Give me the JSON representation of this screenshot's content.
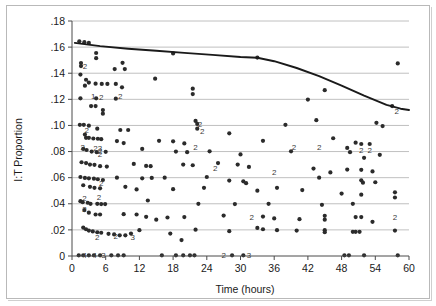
{
  "chart_data": {
    "type": "scatter",
    "title": "",
    "xlabel": "Time (hours)",
    "ylabel": "I:T Proportion",
    "xlim": [
      0,
      60
    ],
    "ylim": [
      0,
      0.18
    ],
    "grid": true,
    "legend": "none",
    "x_ticks": [
      "0",
      "6",
      "12",
      "18",
      "24",
      "30",
      "36",
      "42",
      "48",
      "54",
      "60"
    ],
    "x_tick_values": [
      0,
      6,
      12,
      18,
      24,
      30,
      36,
      42,
      48,
      54,
      60
    ],
    "y_ticks": [
      "0",
      ".02",
      ".04",
      ".06",
      ".08",
      ".10",
      ".12",
      ".14",
      ".16",
      ".18"
    ],
    "y_tick_values": [
      0,
      0.02,
      0.04,
      0.06,
      0.08,
      0.1,
      0.12,
      0.14,
      0.16,
      0.18
    ],
    "series": [
      {
        "name": "I:T Proportion observations",
        "marker": "filled-circle",
        "color": "#2b2b2b",
        "points": [
          [
            1.3,
            0.1645
          ],
          [
            2.2,
            0.1638
          ],
          [
            3.0,
            0.1632
          ],
          [
            4.3,
            0.1555
          ],
          [
            4.3,
            0.1515
          ],
          [
            9.0,
            0.148
          ],
          [
            1.6,
            0.1478
          ],
          [
            1.6,
            0.1455
          ],
          [
            18.0,
            0.1552
          ],
          [
            58.0,
            0.1475
          ],
          [
            7.6,
            0.1432
          ],
          [
            9.4,
            0.1432
          ],
          [
            1.5,
            0.139
          ],
          [
            2.5,
            0.135
          ],
          [
            3.0,
            0.1328
          ],
          [
            2.3,
            0.1305
          ],
          [
            4.2,
            0.132
          ],
          [
            5.3,
            0.1318
          ],
          [
            6.3,
            0.1318
          ],
          [
            7.8,
            0.1318
          ],
          [
            8.9,
            0.1292
          ],
          [
            14.8,
            0.1358
          ],
          [
            21.5,
            0.1282
          ],
          [
            21.5,
            0.124
          ],
          [
            33.0,
            0.152
          ],
          [
            45.0,
            0.127
          ],
          [
            1.5,
            0.1208
          ],
          [
            4.3,
            0.1208
          ],
          [
            7.8,
            0.1205
          ],
          [
            42.0,
            0.1198
          ],
          [
            3.4,
            0.1148
          ],
          [
            4.2,
            0.1148
          ],
          [
            5.5,
            0.1118
          ],
          [
            5.5,
            0.109
          ],
          [
            22.0,
            0.1035
          ],
          [
            22.3,
            0.1012
          ],
          [
            22.3,
            0.0975
          ],
          [
            28.0,
            0.094
          ],
          [
            38.0,
            0.1005
          ],
          [
            43.5,
            0.104
          ],
          [
            54.2,
            0.102
          ],
          [
            55.3,
            0.0995
          ],
          [
            57.0,
            0.1148
          ],
          [
            1.4,
            0.1005
          ],
          [
            2.1,
            0.1005
          ],
          [
            3.0,
            0.0998
          ],
          [
            4.5,
            0.0975
          ],
          [
            8.6,
            0.0965
          ],
          [
            10.0,
            0.0965
          ],
          [
            2.3,
            0.093
          ],
          [
            2.5,
            0.0905
          ],
          [
            3.0,
            0.0905
          ],
          [
            3.8,
            0.09
          ],
          [
            4.6,
            0.0898
          ],
          [
            5.2,
            0.0895
          ],
          [
            8.0,
            0.088
          ],
          [
            9.2,
            0.0865
          ],
          [
            15.5,
            0.0882
          ],
          [
            18.0,
            0.0878
          ],
          [
            20.0,
            0.0862
          ],
          [
            34.0,
            0.0882
          ],
          [
            46.5,
            0.0902
          ],
          [
            50.5,
            0.0868
          ],
          [
            51.5,
            0.0858
          ],
          [
            53.0,
            0.0858
          ],
          [
            2.0,
            0.082
          ],
          [
            2.6,
            0.0812
          ],
          [
            3.5,
            0.08
          ],
          [
            4.4,
            0.0795
          ],
          [
            6.0,
            0.0798
          ],
          [
            12.5,
            0.082
          ],
          [
            18.5,
            0.08
          ],
          [
            20.5,
            0.0795
          ],
          [
            24.5,
            0.0802
          ],
          [
            30.0,
            0.0778
          ],
          [
            39.0,
            0.0802
          ],
          [
            49.0,
            0.0828
          ],
          [
            49.5,
            0.0795
          ],
          [
            52.0,
            0.0752
          ],
          [
            54.8,
            0.0775
          ],
          [
            1.7,
            0.0718
          ],
          [
            2.5,
            0.0712
          ],
          [
            3.2,
            0.07
          ],
          [
            4.0,
            0.0698
          ],
          [
            5.0,
            0.0688
          ],
          [
            6.2,
            0.0685
          ],
          [
            11.0,
            0.0705
          ],
          [
            13.2,
            0.069
          ],
          [
            14.0,
            0.0688
          ],
          [
            19.8,
            0.07
          ],
          [
            21.5,
            0.0695
          ],
          [
            26.0,
            0.0712
          ],
          [
            29.5,
            0.07
          ],
          [
            31.5,
            0.0682
          ],
          [
            43.0,
            0.067
          ],
          [
            46.0,
            0.064
          ],
          [
            49.0,
            0.0662
          ],
          [
            51.5,
            0.066
          ],
          [
            53.5,
            0.0648
          ],
          [
            1.5,
            0.0605
          ],
          [
            2.3,
            0.0598
          ],
          [
            3.0,
            0.0595
          ],
          [
            3.9,
            0.0592
          ],
          [
            4.6,
            0.0588
          ],
          [
            5.5,
            0.0582
          ],
          [
            8.0,
            0.06
          ],
          [
            12.5,
            0.0595
          ],
          [
            14.2,
            0.0598
          ],
          [
            16.5,
            0.06
          ],
          [
            24.0,
            0.0605
          ],
          [
            28.0,
            0.0578
          ],
          [
            30.5,
            0.0572
          ],
          [
            31.0,
            0.0558
          ],
          [
            44.0,
            0.06
          ],
          [
            51.5,
            0.058
          ],
          [
            51.8,
            0.0562
          ],
          [
            54.0,
            0.0565
          ],
          [
            2.0,
            0.0542
          ],
          [
            3.2,
            0.053
          ],
          [
            4.0,
            0.0522
          ],
          [
            5.0,
            0.0518
          ],
          [
            9.5,
            0.053
          ],
          [
            11.5,
            0.051
          ],
          [
            18.0,
            0.0512
          ],
          [
            23.5,
            0.0522
          ],
          [
            33.0,
            0.05
          ],
          [
            36.5,
            0.0522
          ],
          [
            41.0,
            0.0505
          ],
          [
            48.0,
            0.0478
          ],
          [
            51.5,
            0.047
          ],
          [
            57.5,
            0.0488
          ],
          [
            1.5,
            0.042
          ],
          [
            1.9,
            0.0412
          ],
          [
            2.8,
            0.0408
          ],
          [
            3.3,
            0.04
          ],
          [
            4.5,
            0.04
          ],
          [
            5.2,
            0.0398
          ],
          [
            5.9,
            0.0398
          ],
          [
            13.5,
            0.0425
          ],
          [
            22.5,
            0.04
          ],
          [
            29.0,
            0.0398
          ],
          [
            35.0,
            0.04
          ],
          [
            44.5,
            0.0392
          ],
          [
            50.0,
            0.04
          ],
          [
            57.5,
            0.0448
          ],
          [
            2.2,
            0.0352
          ],
          [
            3.0,
            0.0332
          ],
          [
            4.2,
            0.0318
          ],
          [
            5.0,
            0.0318
          ],
          [
            9.2,
            0.032
          ],
          [
            11.5,
            0.0318
          ],
          [
            13.2,
            0.03
          ],
          [
            15.0,
            0.0278
          ],
          [
            17.0,
            0.0295
          ],
          [
            20.0,
            0.0298
          ],
          [
            27.0,
            0.031
          ],
          [
            34.0,
            0.0302
          ],
          [
            36.0,
            0.0288
          ],
          [
            40.5,
            0.0282
          ],
          [
            45.0,
            0.0308
          ],
          [
            45.0,
            0.0278
          ],
          [
            50.5,
            0.0298
          ],
          [
            51.5,
            0.0298
          ],
          [
            53.5,
            0.0262
          ],
          [
            2.0,
            0.0218
          ],
          [
            2.5,
            0.0205
          ],
          [
            3.0,
            0.0195
          ],
          [
            3.7,
            0.0188
          ],
          [
            4.5,
            0.0182
          ],
          [
            5.2,
            0.0178
          ],
          [
            6.5,
            0.017
          ],
          [
            7.5,
            0.0165
          ],
          [
            8.5,
            0.0158
          ],
          [
            9.5,
            0.0158
          ],
          [
            10.5,
            0.0172
          ],
          [
            12.0,
            0.0198
          ],
          [
            17.5,
            0.0172
          ],
          [
            19.5,
            0.0122
          ],
          [
            22.0,
            0.0202
          ],
          [
            28.0,
            0.019
          ],
          [
            33.0,
            0.0215
          ],
          [
            34.0,
            0.0205
          ],
          [
            36.5,
            0.0198
          ],
          [
            40.0,
            0.0195
          ],
          [
            45.0,
            0.0198
          ],
          [
            45.0,
            0.0182
          ],
          [
            50.0,
            0.0185
          ],
          [
            50.5,
            0.0185
          ],
          [
            51.2,
            0.0185
          ],
          [
            57.5,
            0.0195
          ],
          [
            1.2,
            0.0005
          ],
          [
            2.0,
            0.0005
          ],
          [
            3.0,
            0.0005
          ],
          [
            3.9,
            0.0005
          ],
          [
            5.0,
            0.0005
          ],
          [
            7.0,
            0.0005
          ],
          [
            8.2,
            0.0005
          ],
          [
            9.2,
            0.0005
          ],
          [
            16.0,
            0.0005
          ],
          [
            18.5,
            0.0005
          ],
          [
            19.8,
            0.0005
          ],
          [
            21.0,
            0.0005
          ],
          [
            21.8,
            0.0005
          ],
          [
            28.5,
            0.0005
          ],
          [
            30.5,
            0.0005
          ],
          [
            48.5,
            0.0005
          ],
          [
            49.3,
            0.0005
          ],
          [
            52.0,
            0.0005
          ],
          [
            58.0,
            0.0005
          ]
        ]
      }
    ],
    "overlap_count_labels": [
      {
        "text": "2",
        "x": 2.3,
        "y": 0.1455
      },
      {
        "text": "1",
        "x": 3.8,
        "y": 0.1228
      },
      {
        "text": "2",
        "x": 5.2,
        "y": 0.122
      },
      {
        "text": "2",
        "x": 8.6,
        "y": 0.1222
      },
      {
        "text": "2",
        "x": 22.8,
        "y": 0.1012
      },
      {
        "text": "2",
        "x": 23.2,
        "y": 0.0958
      },
      {
        "text": "2",
        "x": 57.8,
        "y": 0.1108
      },
      {
        "text": "2",
        "x": 2.6,
        "y": 0.0962
      },
      {
        "text": "2",
        "x": 1.9,
        "y": 0.0838
      },
      {
        "text": "2",
        "x": 4.2,
        "y": 0.0828
      },
      {
        "text": "3",
        "x": 5.0,
        "y": 0.0828
      },
      {
        "text": "2",
        "x": 5.0,
        "y": 0.0802
      },
      {
        "text": "2",
        "x": 5.0,
        "y": 0.0778
      },
      {
        "text": "2",
        "x": 22.0,
        "y": 0.0838
      },
      {
        "text": "2",
        "x": 39.5,
        "y": 0.0838
      },
      {
        "text": "2",
        "x": 44.0,
        "y": 0.0838
      },
      {
        "text": "2",
        "x": 51.5,
        "y": 0.0812
      },
      {
        "text": "2",
        "x": 53.0,
        "y": 0.0812
      },
      {
        "text": "2",
        "x": 25.5,
        "y": 0.0675
      },
      {
        "text": "2",
        "x": 36.0,
        "y": 0.0645
      },
      {
        "text": "2",
        "x": 5.2,
        "y": 0.0562
      },
      {
        "text": "2",
        "x": 4.8,
        "y": 0.0455
      },
      {
        "text": "2",
        "x": 2.2,
        "y": 0.0448
      },
      {
        "text": "2",
        "x": 2.2,
        "y": 0.0358
      },
      {
        "text": "2",
        "x": 32.0,
        "y": 0.0302
      },
      {
        "text": "2",
        "x": 57.5,
        "y": 0.0295
      },
      {
        "text": "2",
        "x": 4.5,
        "y": 0.0142
      },
      {
        "text": "2",
        "x": 7.8,
        "y": 0.015
      },
      {
        "text": "3",
        "x": 10.8,
        "y": 0.0148
      },
      {
        "text": "4",
        "x": 2.2,
        "y": 0.0005
      },
      {
        "text": "4",
        "x": 4.0,
        "y": 0.0005
      },
      {
        "text": "3",
        "x": 5.6,
        "y": 0.0005
      },
      {
        "text": "2",
        "x": 27.0,
        "y": 0.0005
      },
      {
        "text": "3",
        "x": 31.5,
        "y": 0.0005
      }
    ],
    "trend_line": {
      "name": "fitted trend",
      "color": "#1a1a1a",
      "points": [
        [
          0.5,
          0.1632
        ],
        [
          5.0,
          0.1608
        ],
        [
          10.0,
          0.1588
        ],
        [
          15.0,
          0.1572
        ],
        [
          20.0,
          0.1556
        ],
        [
          25.0,
          0.154
        ],
        [
          30.0,
          0.1524
        ],
        [
          33.0,
          0.1518
        ],
        [
          36.0,
          0.1492
        ],
        [
          40.0,
          0.144
        ],
        [
          44.0,
          0.1378
        ],
        [
          48.0,
          0.1305
        ],
        [
          52.0,
          0.1228
        ],
        [
          56.0,
          0.1158
        ],
        [
          58.5,
          0.1128
        ],
        [
          60.0,
          0.1118
        ]
      ]
    }
  }
}
